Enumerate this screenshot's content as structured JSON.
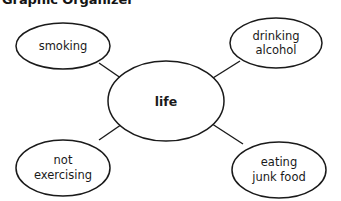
{
  "title": "Graphic Organizer",
  "diagram": {
    "type": "mind-map",
    "background_color": "#ffffff",
    "stroke_color": "#1a1a1a",
    "text_color": "#1a1a1a",
    "center": {
      "label": "life",
      "bold": true
    },
    "branches": [
      {
        "id": "smoking",
        "line1": "smoking",
        "line2": "",
        "position": "top-left"
      },
      {
        "id": "drinking",
        "line1": "drinking",
        "line2": "alcohol",
        "position": "top-right"
      },
      {
        "id": "not-exercising",
        "line1": "not",
        "line2": "exercising",
        "position": "bottom-left"
      },
      {
        "id": "junk-food",
        "line1": "eating",
        "line2": "junk food",
        "position": "bottom-right"
      }
    ]
  }
}
